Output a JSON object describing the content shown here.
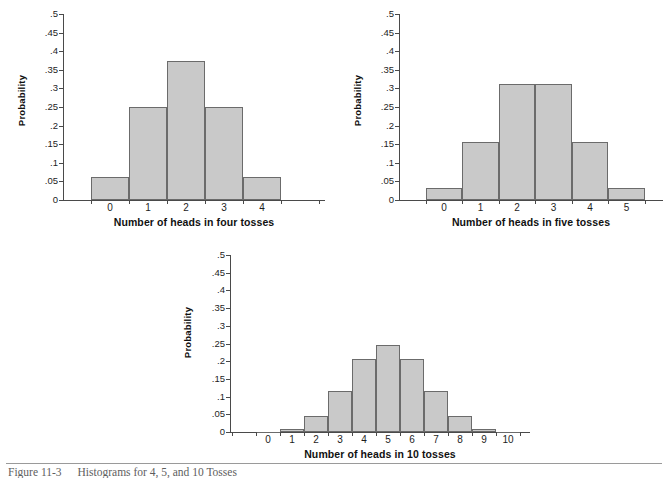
{
  "figure": {
    "caption_number": "Figure 11-3",
    "caption_text": "Histograms for 4, 5, and 10 Tosses"
  },
  "charts": [
    {
      "id": "four-tosses",
      "ylabel": "Probability",
      "xlabel": "Number of heads in four tosses",
      "ytick_labels": [
        "0",
        ".05",
        ".1",
        ".15",
        ".2",
        ".25",
        ".3",
        ".35",
        ".4",
        ".45",
        ".5"
      ],
      "xtick_labels": [
        "0",
        "1",
        "2",
        "3",
        "4"
      ],
      "values": [
        0.0625,
        0.25,
        0.375,
        0.25,
        0.0625
      ]
    },
    {
      "id": "five-tosses",
      "ylabel": "Probability",
      "xlabel": "Number of heads in five tosses",
      "ytick_labels": [
        "0",
        ".05",
        ".1",
        ".15",
        ".2",
        ".25",
        ".3",
        ".35",
        ".4",
        ".45",
        ".5"
      ],
      "xtick_labels": [
        "0",
        "1",
        "2",
        "3",
        "4",
        "5"
      ],
      "values": [
        0.03125,
        0.15625,
        0.3125,
        0.3125,
        0.15625,
        0.03125
      ]
    },
    {
      "id": "ten-tosses",
      "ylabel": "Probability",
      "xlabel": "Number of heads in 10 tosses",
      "ytick_labels": [
        "0",
        ".05",
        ".1",
        ".15",
        ".2",
        ".25",
        ".3",
        ".35",
        ".4",
        ".45",
        ".5"
      ],
      "xtick_labels": [
        "0",
        "1",
        "2",
        "3",
        "4",
        "5",
        "6",
        "7",
        "8",
        "9",
        "10"
      ],
      "values": [
        0.001,
        0.0098,
        0.0439,
        0.1172,
        0.2051,
        0.2461,
        0.2051,
        0.1172,
        0.0439,
        0.0098,
        0.001
      ]
    }
  ],
  "chart_data": [
    {
      "type": "bar",
      "title": "",
      "xlabel": "Number of heads in four tosses",
      "ylabel": "Probability",
      "categories": [
        "0",
        "1",
        "2",
        "3",
        "4"
      ],
      "values": [
        0.0625,
        0.25,
        0.375,
        0.25,
        0.0625
      ],
      "ylim": [
        0,
        0.5
      ],
      "yticks": [
        0,
        0.05,
        0.1,
        0.15,
        0.2,
        0.25,
        0.3,
        0.35,
        0.4,
        0.45,
        0.5
      ],
      "grid": false,
      "legend": "none"
    },
    {
      "type": "bar",
      "title": "",
      "xlabel": "Number of heads in five tosses",
      "ylabel": "Probability",
      "categories": [
        "0",
        "1",
        "2",
        "3",
        "4",
        "5"
      ],
      "values": [
        0.03125,
        0.15625,
        0.3125,
        0.3125,
        0.15625,
        0.03125
      ],
      "ylim": [
        0,
        0.5
      ],
      "yticks": [
        0,
        0.05,
        0.1,
        0.15,
        0.2,
        0.25,
        0.3,
        0.35,
        0.4,
        0.45,
        0.5
      ],
      "grid": false,
      "legend": "none"
    },
    {
      "type": "bar",
      "title": "",
      "xlabel": "Number of heads in 10 tosses",
      "ylabel": "Probability",
      "categories": [
        "0",
        "1",
        "2",
        "3",
        "4",
        "5",
        "6",
        "7",
        "8",
        "9",
        "10"
      ],
      "values": [
        0.001,
        0.0098,
        0.0439,
        0.1172,
        0.2051,
        0.2461,
        0.2051,
        0.1172,
        0.0439,
        0.0098,
        0.001
      ],
      "ylim": [
        0,
        0.5
      ],
      "yticks": [
        0,
        0.05,
        0.1,
        0.15,
        0.2,
        0.25,
        0.3,
        0.35,
        0.4,
        0.45,
        0.5
      ],
      "grid": false,
      "legend": "none"
    }
  ]
}
